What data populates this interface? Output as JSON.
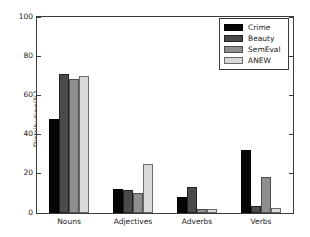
{
  "chart_data": {
    "type": "bar",
    "title": "",
    "xlabel": "",
    "ylabel": "Distribution(%)",
    "categories": [
      "Nouns",
      "Adjectives",
      "Adverbs",
      "Verbs"
    ],
    "series": [
      {
        "name": "Crime",
        "color": "#050505",
        "values": [
          48,
          12,
          8,
          32
        ]
      },
      {
        "name": "Beauty",
        "color": "#4a4a4a",
        "values": [
          71,
          11.5,
          13.5,
          3.5
        ]
      },
      {
        "name": "SemEval",
        "color": "#8e8e8e",
        "values": [
          68.5,
          10,
          2.2,
          18.5
        ]
      },
      {
        "name": "ANEW",
        "color": "#d9d9d9",
        "values": [
          70,
          25,
          1.8,
          2.5
        ]
      }
    ],
    "ylim": [
      0,
      100
    ],
    "yticks": [
      0,
      20,
      40,
      60,
      80,
      100
    ],
    "ytick_labels": [
      "0",
      "20",
      "40",
      "60",
      "80",
      "100"
    ],
    "grid": false,
    "legend_position": "top-right",
    "legend_entries": [
      "Crime",
      "Beauty",
      "SemEval",
      "ANEW"
    ]
  }
}
